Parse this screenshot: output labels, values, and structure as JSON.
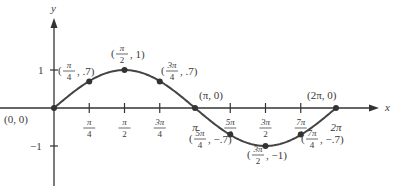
{
  "chart_data": {
    "type": "line",
    "title": "",
    "function": "y = sin(x)",
    "xlabel": "x",
    "ylabel": "y",
    "xlim": [
      0,
      6.283
    ],
    "ylim": [
      -1,
      1
    ],
    "grid": false,
    "legend": null,
    "x_ticks": [
      {
        "value": 0.7854,
        "label": "π/4",
        "num": "π",
        "den": "4"
      },
      {
        "value": 1.5708,
        "label": "π/2",
        "num": "π",
        "den": "2"
      },
      {
        "value": 2.3562,
        "label": "3π/4",
        "num": "3π",
        "den": "4"
      },
      {
        "value": 3.1416,
        "label": "π",
        "num": "π",
        "den": ""
      },
      {
        "value": 3.927,
        "label": "5π/4",
        "num": "5π",
        "den": "4"
      },
      {
        "value": 4.7124,
        "label": "3π/2",
        "num": "3π",
        "den": "2"
      },
      {
        "value": 5.4978,
        "label": "7π/4",
        "num": "7π",
        "den": "4"
      },
      {
        "value": 6.2832,
        "label": "2π",
        "num": "2π",
        "den": ""
      }
    ],
    "y_ticks": [
      {
        "value": 1,
        "label": "1"
      },
      {
        "value": -1,
        "label": "−1"
      }
    ],
    "points": [
      {
        "x": 0,
        "y": 0,
        "label": "(0, 0)"
      },
      {
        "x": 0.7854,
        "y": 0.7,
        "label": "(π/4, .7)"
      },
      {
        "x": 1.5708,
        "y": 1,
        "label": "(π/2, 1)"
      },
      {
        "x": 2.3562,
        "y": 0.7,
        "label": "(3π/4, .7)"
      },
      {
        "x": 3.1416,
        "y": 0,
        "label": "(π, 0)"
      },
      {
        "x": 3.927,
        "y": -0.7,
        "label": "(5π/4, −.7)"
      },
      {
        "x": 4.7124,
        "y": -1,
        "label": "(3π/2, −1)"
      },
      {
        "x": 5.4978,
        "y": -0.7,
        "label": "(7π/4, −.7)"
      },
      {
        "x": 6.2832,
        "y": 0,
        "label": "(2π, 0)"
      }
    ]
  },
  "labels": {
    "origin": "(0, 0)",
    "pi_point": "(π, 0)",
    "two_pi_point": "(2π, 0)",
    "x_axis": "x",
    "y_axis": "y",
    "y_tick_pos": "1",
    "y_tick_neg": "−1"
  }
}
